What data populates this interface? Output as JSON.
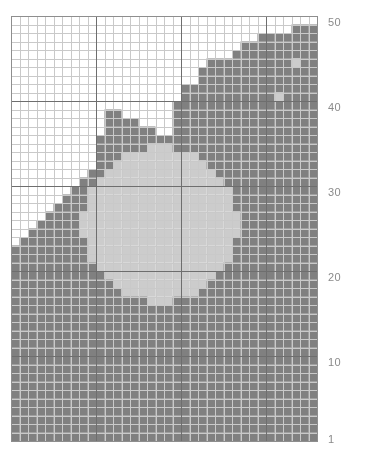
{
  "chart_data": {
    "type": "heatmap",
    "title": "",
    "xlabel": "",
    "ylabel": "",
    "grid": {
      "columns": 36,
      "rows": 50,
      "cell_px": 8.5,
      "origin_x": 11,
      "origin_y": 16,
      "row_numbering": "bottom-to-top",
      "grid_on": true,
      "major_gridline_every": 10,
      "legend_position": "right"
    },
    "colors": {
      "empty": "#ffffff",
      "filled": "#808080",
      "motif": "#cccccc",
      "minor_gridline": "#c9c9c9",
      "major_gridline": "#6e6e6e",
      "border": "#8e8e8e",
      "label_text": "#8a8a8a"
    },
    "legend": {
      "symbols": [
        {
          "name": "empty",
          "label": "",
          "color": "#ffffff"
        },
        {
          "name": "filled",
          "label": "",
          "color": "#808080"
        },
        {
          "name": "motif",
          "label": "",
          "color": "#cccccc"
        }
      ]
    },
    "row_labels": [
      {
        "value": "50",
        "row": 50
      },
      {
        "value": "40",
        "row": 40
      },
      {
        "value": "30",
        "row": 30
      },
      {
        "value": "20",
        "row": 20
      },
      {
        "value": "10",
        "row": 10
      },
      {
        "value": "1",
        "row": 1
      }
    ],
    "categories": [
      "1",
      "2",
      "3",
      "4",
      "5",
      "6",
      "7",
      "8",
      "9",
      "10",
      "11",
      "12",
      "13",
      "14",
      "15",
      "16",
      "17",
      "18",
      "19",
      "20",
      "21",
      "22",
      "23",
      "24",
      "25",
      "26",
      "27",
      "28",
      "29",
      "30",
      "31",
      "32",
      "33",
      "34",
      "35",
      "36"
    ],
    "cells": [
      "000000000000000000000000000000000000",
      "000000000000000000000000000000000111",
      "000000000000000000000000000001111111",
      "000000000000000000000000000111111111",
      "000000000000000000000000001111111111",
      "000000000000000000000001111111111211",
      "000000000000000000000011111111111111",
      "000000000000000000000011111111111111",
      "000000000000000000001111111111111111",
      "000000000000000000001111111111121111",
      "000000000000000000011111111111111111",
      "000000000001100000011111111111111111",
      "000000000001111000011111111111111111",
      "000000000001111110011111111111111111",
      "000000000011111111111111111111111111",
      "000000000011111111111111111111111111",
      "000000000011111111111111111111111111",
      "000000000011111111111111111111111111",
      "000000000111111111111111111111111111",
      "000000001111111111111111111111111111",
      "000000011111111111111111111111111111",
      "000000111111111111111111111111111111",
      "000001111111111111111111111111111111",
      "000011111111111111111111111111111111",
      "000111111111111111111111111111111111",
      "001111111111111111111111111111111111",
      "011111111111111111111111111111111111",
      "111111111111111111111111111111111111",
      "111111111111111111111111111111111111",
      "111111111111111111111111111111111111",
      "111111111111111111111111111111111111",
      "111111111111111111111111111111111111",
      "111111111111111111111111111111111111",
      "111111111111111111111111111111111111",
      "111111111111111111111111111111111111",
      "111111111111111111111111111111111111",
      "111111111111111111111111111111111111",
      "111111111111111111111111111111111111",
      "111111111111111111111111111111111111",
      "111111111111111111111111111111111111",
      "111111111111111111111111111111111111",
      "111111111111111111111111111111111111",
      "111111111111111111111111111111111111",
      "111111111111111111111111111111111111",
      "111111111111111111111111111111111111",
      "111111111111111111111111111111111111",
      "111111111111111111111111111111111111",
      "111111111111111111111111111111111111",
      "111111111111111111111111111111111111",
      "111111111111111111111111111111111111"
    ],
    "motif": {
      "shape": "circle",
      "center_col": 17.5,
      "center_row": 25.5,
      "radius_cols": 9.2,
      "fill": "#cccccc"
    }
  }
}
